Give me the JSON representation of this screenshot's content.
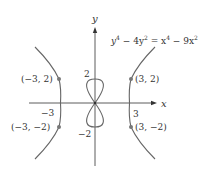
{
  "figure": {
    "equation": {
      "y4": "y",
      "exp4a": "4",
      "minus4y2": " − 4y",
      "exp2a": "2",
      "eq": " = x",
      "exp4b": "4",
      "minus9x2": " − 9x",
      "exp2b": "2"
    },
    "axes": {
      "x_label": "x",
      "y_label": "y",
      "x_tick_neg": "−3",
      "x_tick_pos": "3",
      "y_tick_pos": "2",
      "y_tick_neg": "−2"
    },
    "points": [
      {
        "label": "(−3, 2)",
        "x": -3,
        "y": 2
      },
      {
        "label": "(3, 2)",
        "x": 3,
        "y": 2
      },
      {
        "label": "(−3, −2)",
        "x": -3,
        "y": -2
      },
      {
        "label": "(3, −2)",
        "x": 3,
        "y": -2
      }
    ],
    "colors": {
      "curve": "#666666",
      "axis": "#333333",
      "point": "#777777",
      "text": "#333333"
    }
  }
}
